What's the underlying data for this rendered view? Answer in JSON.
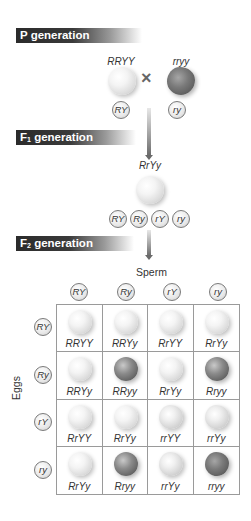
{
  "p_generation": {
    "label": "P generation",
    "parent1": {
      "genotype": "RRYY",
      "phenotype": "yellow-round"
    },
    "cross_symbol": "×",
    "parent2": {
      "genotype": "rryy",
      "phenotype": "green-wrinkled"
    },
    "gametes": [
      "RY",
      "ry"
    ]
  },
  "f1_generation": {
    "label_main": "F",
    "label_sub": "1",
    "label_rest": " generation",
    "genotype": "RrYy",
    "phenotype": "yellow-round",
    "gametes": [
      "RY",
      "Ry",
      "rY",
      "ry"
    ]
  },
  "f2_generation": {
    "label_main": "F",
    "label_sub": "2",
    "label_rest": " generation",
    "sperm_label": "Sperm",
    "eggs_label": "Eggs",
    "sperm_gametes": [
      "RY",
      "Ry",
      "rY",
      "ry"
    ],
    "egg_gametes": [
      "RY",
      "Ry",
      "rY",
      "ry"
    ],
    "punnett": [
      [
        {
          "g": "RRYY",
          "p": "yellow-round"
        },
        {
          "g": "RRYy",
          "p": "yellow-round"
        },
        {
          "g": "RrYY",
          "p": "yellow-round"
        },
        {
          "g": "RrYy",
          "p": "yellow-round"
        }
      ],
      [
        {
          "g": "RRYy",
          "p": "yellow-round"
        },
        {
          "g": "RRyy",
          "p": "green-round"
        },
        {
          "g": "RrYy",
          "p": "yellow-round"
        },
        {
          "g": "Rryy",
          "p": "green-round"
        }
      ],
      [
        {
          "g": "RrYY",
          "p": "yellow-round"
        },
        {
          "g": "RrYy",
          "p": "yellow-round"
        },
        {
          "g": "rrYY",
          "p": "yellow-wrinkled"
        },
        {
          "g": "rrYy",
          "p": "yellow-wrinkled"
        }
      ],
      [
        {
          "g": "RrYy",
          "p": "yellow-round"
        },
        {
          "g": "Rryy",
          "p": "green-round"
        },
        {
          "g": "rrYy",
          "p": "yellow-wrinkled"
        },
        {
          "g": "rryy",
          "p": "green-wrinkled"
        }
      ]
    ]
  }
}
